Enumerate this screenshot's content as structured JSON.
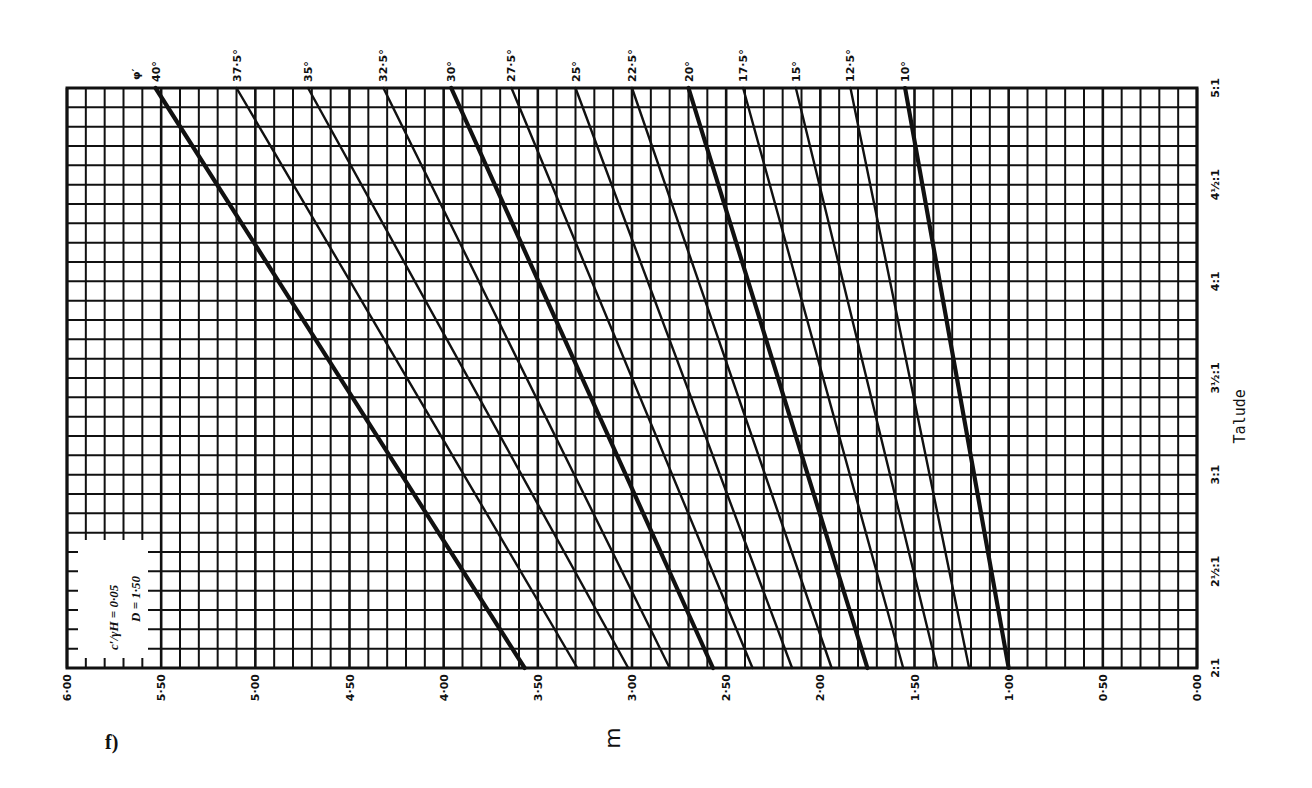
{
  "figure_label": "f)",
  "chart_data": {
    "type": "line",
    "title": "",
    "orientation_note": "printed rotated 90°: m axis runs along bottom (6.00 left to 0.00 right), Talude axis along right (2:1 bottom to 5:1 top)",
    "xlabel": "m",
    "ylabel": "Talude",
    "x_ticks": [
      "6·00",
      "5·50",
      "5·00",
      "4·50",
      "4·00",
      "3·50",
      "3·00",
      "2·50",
      "2·00",
      "1·50",
      "1·00",
      "0·50",
      "0·00"
    ],
    "x_tick_values": [
      6.0,
      5.5,
      5.0,
      4.5,
      4.0,
      3.5,
      3.0,
      2.5,
      2.0,
      1.5,
      1.0,
      0.5,
      0.0
    ],
    "y_ticks": [
      "2:1",
      "2½:1",
      "3:1",
      "3½:1",
      "4:1",
      "4½:1",
      "5:1"
    ],
    "y_tick_values": [
      2.0,
      2.5,
      3.0,
      3.5,
      4.0,
      4.5,
      5.0
    ],
    "xlim": [
      6.0,
      0.0
    ],
    "ylim": [
      2.0,
      5.0
    ],
    "grid": true,
    "grid_step_m": 0.1,
    "grid_step_talude": 0.1,
    "legend_box": {
      "line1": "c′/γH = 0·05",
      "line2": "D = 1·50"
    },
    "series_label_prefix": "φ′",
    "series": [
      {
        "name": "40°",
        "label": "40°",
        "bold": true,
        "slope": [
          2.0,
          5.0
        ],
        "m": [
          3.57,
          5.53
        ]
      },
      {
        "name": "37.5°",
        "label": "37·5°",
        "bold": false,
        "slope": [
          2.0,
          5.0
        ],
        "m": [
          3.29,
          5.1
        ]
      },
      {
        "name": "35°",
        "label": "35°",
        "bold": false,
        "slope": [
          2.0,
          5.0
        ],
        "m": [
          3.02,
          4.72
        ]
      },
      {
        "name": "32.5°",
        "label": "32·5°",
        "bold": false,
        "slope": [
          2.0,
          5.0
        ],
        "m": [
          2.8,
          4.32
        ]
      },
      {
        "name": "30°",
        "label": "30°",
        "bold": true,
        "slope": [
          2.0,
          5.0
        ],
        "m": [
          2.57,
          3.96
        ]
      },
      {
        "name": "27.5°",
        "label": "27·5°",
        "bold": false,
        "slope": [
          2.0,
          5.0
        ],
        "m": [
          2.36,
          3.64
        ]
      },
      {
        "name": "25°",
        "label": "25°",
        "bold": false,
        "slope": [
          2.0,
          5.0
        ],
        "m": [
          2.15,
          3.3
        ]
      },
      {
        "name": "22.5°",
        "label": "22·5°",
        "bold": false,
        "slope": [
          2.0,
          5.0
        ],
        "m": [
          1.94,
          3.0
        ]
      },
      {
        "name": "20°",
        "label": "20°",
        "bold": true,
        "slope": [
          2.0,
          5.0
        ],
        "m": [
          1.75,
          2.7
        ]
      },
      {
        "name": "17.5°",
        "label": "17·5°",
        "bold": false,
        "slope": [
          2.0,
          5.0
        ],
        "m": [
          1.56,
          2.41
        ]
      },
      {
        "name": "15°",
        "label": "15°",
        "bold": false,
        "slope": [
          2.0,
          5.0
        ],
        "m": [
          1.38,
          2.13
        ]
      },
      {
        "name": "12.5°",
        "label": "12·5°",
        "bold": false,
        "slope": [
          2.0,
          5.0
        ],
        "m": [
          1.21,
          1.84
        ]
      },
      {
        "name": "10°",
        "label": "10°",
        "bold": true,
        "slope": [
          2.0,
          5.0
        ],
        "m": [
          1.0,
          1.55
        ]
      }
    ]
  },
  "colors": {
    "ink": "#111111",
    "paper": "#ffffff"
  }
}
